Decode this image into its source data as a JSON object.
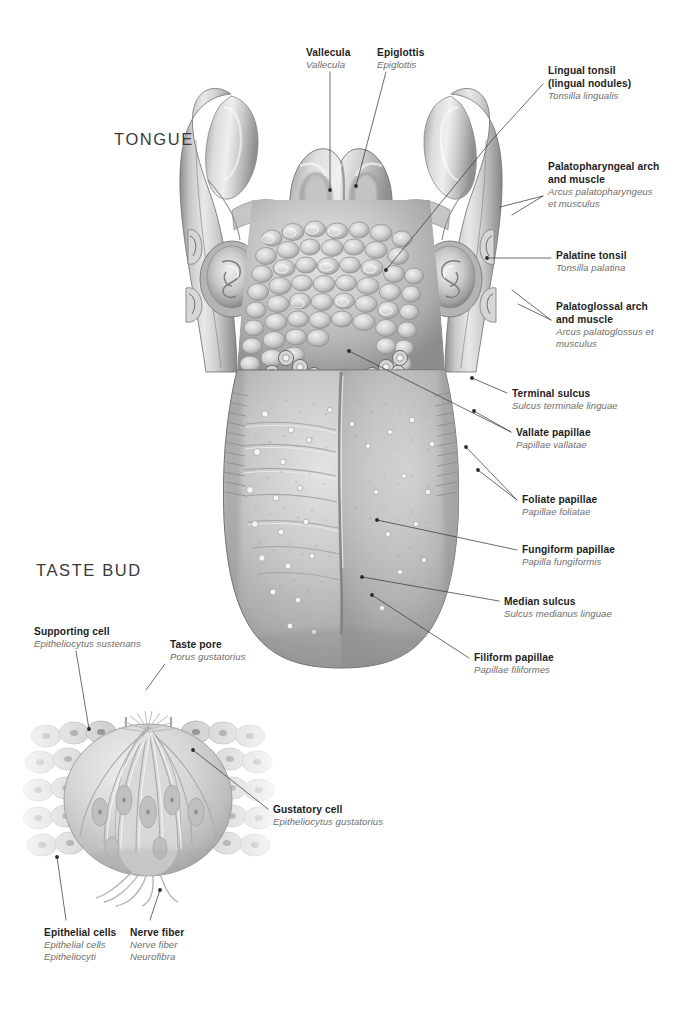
{
  "page": {
    "background": "#ffffff",
    "width": 683,
    "height": 1009,
    "text_color_primary": "#1d1d1d",
    "text_color_latin": "#6e6e6e",
    "leader_line_color": "#3b3b3b"
  },
  "sections": {
    "tongue_heading": "TONGUE",
    "taste_bud_heading": "TASTE BUD"
  },
  "tongue_labels": [
    {
      "id": "vallecula",
      "en": "Vallecula",
      "la": [
        "Vallecula"
      ],
      "x": 306,
      "y": 48,
      "align": "left"
    },
    {
      "id": "epiglottis",
      "en": "Epiglottis",
      "la": [
        "Epiglottis"
      ],
      "x": 377,
      "y": 48,
      "align": "left"
    },
    {
      "id": "lingual-tonsil",
      "en": "Lingual tonsil\n(lingual nodules)",
      "en_lines": [
        "Lingual tonsil",
        "(lingual nodules)"
      ],
      "la": [
        "Tonsilla lingualis"
      ],
      "x": 548,
      "y": 66,
      "align": "left"
    },
    {
      "id": "palatopharyngeal-arch",
      "en_lines": [
        "Palatopharyngeal arch",
        "and muscle"
      ],
      "la": [
        "Arcus palatopharyngeus",
        "et musculus"
      ],
      "x": 548,
      "y": 162,
      "align": "left"
    },
    {
      "id": "palatine-tonsil",
      "en_lines": [
        "Palatine tonsil"
      ],
      "la": [
        "Tonsilla palatina"
      ],
      "x": 556,
      "y": 251,
      "align": "left"
    },
    {
      "id": "palatoglossal-arch",
      "en_lines": [
        "Palatoglossal arch",
        "and muscle"
      ],
      "la": [
        "Arcus palatoglossus et",
        "musculus"
      ],
      "x": 556,
      "y": 302,
      "align": "left"
    },
    {
      "id": "terminal-sulcus",
      "en_lines": [
        "Terminal sulcus"
      ],
      "la": [
        "Sulcus terminale linguae"
      ],
      "x": 512,
      "y": 389,
      "align": "left"
    },
    {
      "id": "vallate-papillae",
      "en_lines": [
        "Vallate papillae"
      ],
      "la": [
        "Papillae vallatae"
      ],
      "x": 516,
      "y": 428,
      "align": "left"
    },
    {
      "id": "foliate-papillae",
      "en_lines": [
        "Foliate papillae"
      ],
      "la": [
        "Papillae foliatae"
      ],
      "x": 522,
      "y": 495,
      "align": "left"
    },
    {
      "id": "fungiform-papillae",
      "en_lines": [
        "Fungiform papillae"
      ],
      "la": [
        "Papilla fungiformis"
      ],
      "x": 522,
      "y": 545,
      "align": "left"
    },
    {
      "id": "median-sulcus",
      "en_lines": [
        "Median sulcus"
      ],
      "la": [
        "Sulcus medianus linguae"
      ],
      "x": 504,
      "y": 597,
      "align": "left"
    },
    {
      "id": "filiform-papillae",
      "en_lines": [
        "Filiform papillae"
      ],
      "la": [
        "Papillae filiformes"
      ],
      "x": 474,
      "y": 653,
      "align": "left"
    }
  ],
  "taste_bud_labels": [
    {
      "id": "supporting-cell",
      "en_lines": [
        "Supporting cell"
      ],
      "la": [
        "Epitheliocytus sustenans"
      ],
      "x": 34,
      "y": 627,
      "align": "left"
    },
    {
      "id": "taste-pore",
      "en_lines": [
        "Taste pore"
      ],
      "la": [
        "Porus gustatorius"
      ],
      "x": 170,
      "y": 640,
      "align": "left"
    },
    {
      "id": "gustatory-cell",
      "en_lines": [
        "Gustatory cell"
      ],
      "la": [
        "Epitheliocytus gustatorius"
      ],
      "x": 273,
      "y": 805,
      "align": "left"
    },
    {
      "id": "epithelial-cells",
      "en_lines": [
        "Epithelial cells"
      ],
      "la": [
        "Epithelial cells",
        "Epitheliocyti"
      ],
      "x": 44,
      "y": 928,
      "align": "left"
    },
    {
      "id": "nerve-fiber",
      "en_lines": [
        "Nerve fiber"
      ],
      "la": [
        "Nerve fiber",
        "Neurofibra"
      ],
      "x": 130,
      "y": 928,
      "align": "left"
    }
  ],
  "leader_lines": [
    {
      "id": "leader-vallecula",
      "points": "330,72 330,190"
    },
    {
      "id": "leader-epiglottis",
      "points": "386,72 356,186"
    },
    {
      "id": "leader-lingual-tonsil",
      "points": "543,84 492,140 386,270"
    },
    {
      "id": "leader-palatopharyngeal",
      "points": "543,196 500,207"
    },
    {
      "id": "leader-palatopharyngeal-2",
      "points": "543,196 512,215"
    },
    {
      "id": "leader-palatine-tonsil",
      "points": "551,258 487,258"
    },
    {
      "id": "leader-palatoglossal",
      "points": "551,320 512,290"
    },
    {
      "id": "leader-palatoglossal-2",
      "points": "551,320 518,304"
    },
    {
      "id": "leader-terminal-sulcus",
      "points": "507,393 472,378"
    },
    {
      "id": "leader-vallate",
      "points": "511,432 474,411"
    },
    {
      "id": "leader-vallate-2",
      "points": "511,432 349,351"
    },
    {
      "id": "leader-foliate",
      "points": "517,500 478,470"
    },
    {
      "id": "leader-foliate-2",
      "points": "517,500 466,447"
    },
    {
      "id": "leader-fungiform",
      "points": "517,550 377,520"
    },
    {
      "id": "leader-median-sulcus",
      "points": "499,601 362,577"
    },
    {
      "id": "leader-filiform",
      "points": "469,658 372,595"
    },
    {
      "id": "leader-supporting-cell",
      "points": "76,651 89,729"
    },
    {
      "id": "leader-taste-pore",
      "points": "165,664 146,690"
    },
    {
      "id": "leader-gustatory-cell",
      "points": "268,809 193,750"
    },
    {
      "id": "leader-epithelial-cells",
      "points": "66,920 57,857"
    },
    {
      "id": "leader-nerve-fiber",
      "points": "150,920 160,890"
    }
  ]
}
